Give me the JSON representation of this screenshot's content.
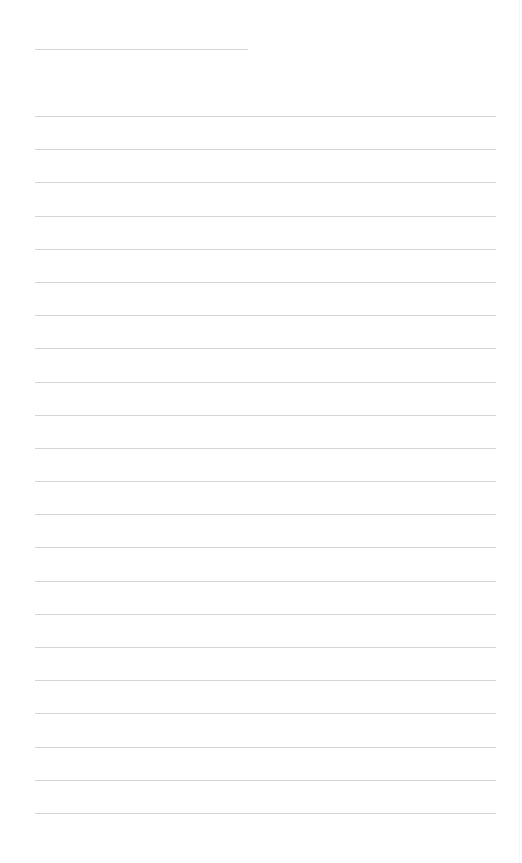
{
  "page": {
    "type": "lined-paper",
    "background_color": "#ffffff",
    "line_color": "#d4d4d4",
    "title_line": {
      "x_start": 35,
      "x_end": 248,
      "y": 49
    },
    "ruled_lines": {
      "count": 22,
      "x_start": 35,
      "x_end": 496,
      "first_y": 116,
      "spacing": 33.2
    }
  }
}
